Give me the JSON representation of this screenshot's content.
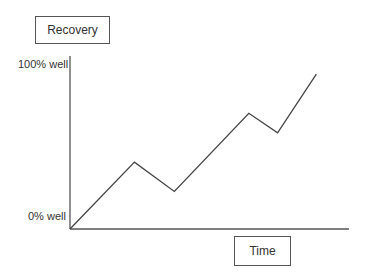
{
  "chart_data": {
    "type": "line",
    "title": "Recovery",
    "xlabel": "Time",
    "ylabel": "",
    "ytick_labels": [
      "0% well",
      "100% well"
    ],
    "ylim": [
      0,
      100
    ],
    "xlim": [
      0,
      100
    ],
    "grid": false,
    "series": [
      {
        "name": "Recovery",
        "x": [
          0,
          23.1,
          37.4,
          64.1,
          74.4,
          88.3
        ],
        "y": [
          0,
          41,
          23,
          71,
          59,
          95
        ]
      }
    ]
  }
}
